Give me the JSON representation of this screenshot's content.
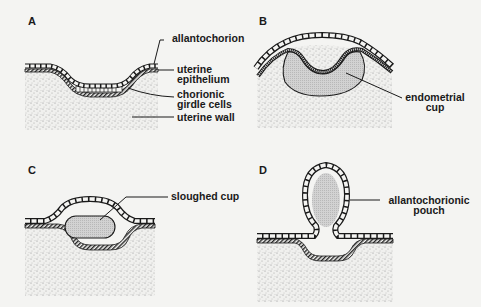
{
  "panels": [
    {
      "letter": "A",
      "labels": [
        "allantochorion",
        "uterine",
        "epithelium",
        "chorionic",
        "girdle cells",
        "uterine wall"
      ]
    },
    {
      "letter": "B",
      "labels": [
        "endometrial",
        "cup"
      ]
    },
    {
      "letter": "C",
      "labels": [
        "sloughed cup"
      ]
    },
    {
      "letter": "D",
      "labels": [
        "allantochorionic",
        "pouch"
      ]
    }
  ],
  "colors": {
    "background": "#f4f4f2",
    "ink": "#1a1a1a",
    "stipple": "#9a9a9a",
    "cup_fill": "#c9c9c9"
  }
}
